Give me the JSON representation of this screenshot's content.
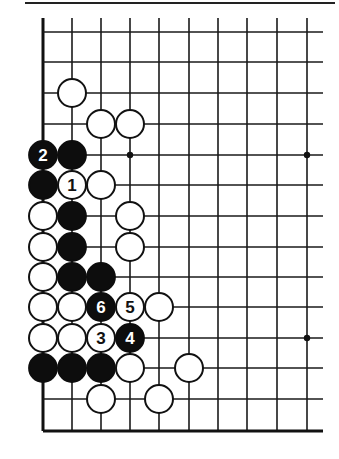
{
  "diagram": {
    "type": "go-board-fragment",
    "title": "",
    "board": {
      "columns_x": [
        43,
        72,
        101,
        130,
        159,
        189,
        218,
        247,
        277,
        307
      ],
      "rows_y": [
        32,
        62,
        93,
        124,
        155,
        185,
        216,
        247,
        277,
        307,
        338,
        368,
        399,
        431
      ],
      "line_top_extent": 18,
      "line_right_extent": 323,
      "left_edge": true,
      "bottom_edge": true,
      "top_rule": {
        "x1": 25,
        "x2": 335,
        "y": 3
      },
      "stone_radius": 14
    },
    "star_points": [
      {
        "col": 3,
        "row": 4
      },
      {
        "col": 9,
        "row": 4
      },
      {
        "col": 9,
        "row": 10
      }
    ],
    "stones": [
      {
        "col": 1,
        "row": 2,
        "color": "white",
        "label": ""
      },
      {
        "col": 2,
        "row": 3,
        "color": "white",
        "label": ""
      },
      {
        "col": 3,
        "row": 3,
        "color": "white",
        "label": ""
      },
      {
        "col": 0,
        "row": 4,
        "color": "black",
        "label": "2"
      },
      {
        "col": 1,
        "row": 4,
        "color": "black",
        "label": ""
      },
      {
        "col": 0,
        "row": 5,
        "color": "black",
        "label": ""
      },
      {
        "col": 1,
        "row": 5,
        "color": "white",
        "label": "1"
      },
      {
        "col": 2,
        "row": 5,
        "color": "white",
        "label": ""
      },
      {
        "col": 0,
        "row": 6,
        "color": "white",
        "label": ""
      },
      {
        "col": 1,
        "row": 6,
        "color": "black",
        "label": ""
      },
      {
        "col": 3,
        "row": 6,
        "color": "white",
        "label": ""
      },
      {
        "col": 0,
        "row": 7,
        "color": "white",
        "label": ""
      },
      {
        "col": 1,
        "row": 7,
        "color": "black",
        "label": ""
      },
      {
        "col": 3,
        "row": 7,
        "color": "white",
        "label": ""
      },
      {
        "col": 0,
        "row": 8,
        "color": "white",
        "label": ""
      },
      {
        "col": 1,
        "row": 8,
        "color": "black",
        "label": ""
      },
      {
        "col": 2,
        "row": 8,
        "color": "black",
        "label": ""
      },
      {
        "col": 0,
        "row": 9,
        "color": "white",
        "label": ""
      },
      {
        "col": 1,
        "row": 9,
        "color": "white",
        "label": ""
      },
      {
        "col": 2,
        "row": 9,
        "color": "black",
        "label": "6"
      },
      {
        "col": 3,
        "row": 9,
        "color": "white",
        "label": "5"
      },
      {
        "col": 4,
        "row": 9,
        "color": "white",
        "label": ""
      },
      {
        "col": 0,
        "row": 10,
        "color": "white",
        "label": ""
      },
      {
        "col": 1,
        "row": 10,
        "color": "white",
        "label": ""
      },
      {
        "col": 2,
        "row": 10,
        "color": "white",
        "label": "3"
      },
      {
        "col": 3,
        "row": 10,
        "color": "black",
        "label": "4"
      },
      {
        "col": 0,
        "row": 11,
        "color": "black",
        "label": ""
      },
      {
        "col": 1,
        "row": 11,
        "color": "black",
        "label": ""
      },
      {
        "col": 2,
        "row": 11,
        "color": "black",
        "label": ""
      },
      {
        "col": 3,
        "row": 11,
        "color": "white",
        "label": ""
      },
      {
        "col": 5,
        "row": 11,
        "color": "white",
        "label": ""
      },
      {
        "col": 2,
        "row": 12,
        "color": "white",
        "label": ""
      },
      {
        "col": 4,
        "row": 12,
        "color": "white",
        "label": ""
      }
    ],
    "move_labels": [
      "1",
      "2",
      "3",
      "4",
      "5",
      "6"
    ],
    "colors": {
      "line": "#1a1a1a",
      "black_stone": "#0d0d0d",
      "white_stone": "#ffffff",
      "background": "#ffffff"
    }
  }
}
